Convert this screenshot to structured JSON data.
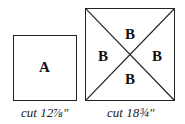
{
  "square_a": {
    "label": "A",
    "caption": "cut 12⅞\""
  },
  "square_b": {
    "labels": {
      "top": "B",
      "left": "B",
      "right": "B",
      "bottom": "B"
    },
    "caption": "cut 18¾\""
  }
}
